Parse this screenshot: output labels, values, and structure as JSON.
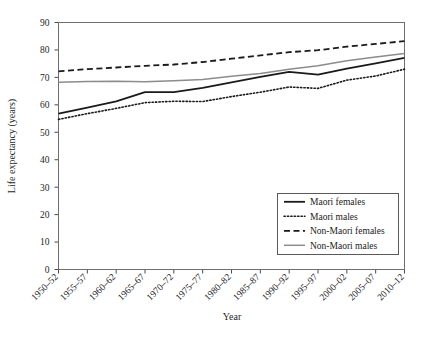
{
  "chart_data": {
    "type": "line",
    "title": "",
    "xlabel": "Year",
    "ylabel": "Life expectancy (years)",
    "categories": [
      "1950–52",
      "1955–57",
      "1960–62",
      "1965–67",
      "1970–72",
      "1975–77",
      "1980–82",
      "1985–87",
      "1990–92",
      "1995–97",
      "2000–02",
      "2005–07",
      "2010–12"
    ],
    "ylim": [
      0,
      90
    ],
    "yticks": [
      0,
      10,
      20,
      30,
      40,
      50,
      60,
      70,
      80,
      90
    ],
    "grid": false,
    "legend_position": "lower right",
    "series": [
      {
        "name": "Maori females",
        "style": "solid",
        "color": "#1a1a1a",
        "width": 1.8,
        "values": [
          56.8,
          59.0,
          61.3,
          64.6,
          64.6,
          66.2,
          68.2,
          70.2,
          72.0,
          71.0,
          73.2,
          75.1,
          77.1
        ]
      },
      {
        "name": "Maori males",
        "style": "dotted",
        "color": "#1a1a1a",
        "width": 1.6,
        "values": [
          54.7,
          56.8,
          58.7,
          60.8,
          61.3,
          61.2,
          63.0,
          64.6,
          66.5,
          66.0,
          69.0,
          70.5,
          73.0
        ]
      },
      {
        "name": "Non-Maori females",
        "style": "dashed",
        "color": "#1a1a1a",
        "width": 1.8,
        "values": [
          72.2,
          73.0,
          73.6,
          74.2,
          74.7,
          75.6,
          76.8,
          78.0,
          79.2,
          79.9,
          81.2,
          82.2,
          83.2
        ]
      },
      {
        "name": "Non-Maori males",
        "style": "solid",
        "color": "#8c8c8c",
        "width": 1.5,
        "values": [
          68.2,
          68.5,
          68.6,
          68.4,
          68.8,
          69.2,
          70.4,
          71.4,
          73.0,
          74.2,
          76.1,
          77.4,
          78.7
        ]
      }
    ]
  },
  "axes": {
    "x_title": "Year",
    "y_title": "Life expectancy (years)"
  },
  "legend": {
    "items": [
      {
        "label": "Maori females"
      },
      {
        "label": "Maori males"
      },
      {
        "label": "Non-Maori females"
      },
      {
        "label": "Non-Maori males"
      }
    ]
  }
}
